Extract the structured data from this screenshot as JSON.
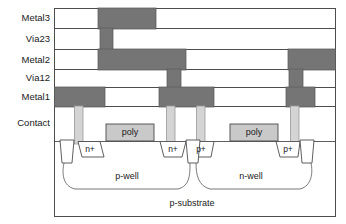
{
  "figure": {
    "type": "cross-section-diagram"
  },
  "colors": {
    "metal_fill": "#757575",
    "metal_stroke": "#5a5a5a",
    "poly_fill": "#c9c9c9",
    "poly_stroke": "#4a4a4a",
    "contact_fill": "#d4d4d4",
    "contact_stroke": "#9a9a9a",
    "outline": "#4d4d4d",
    "background": "#ffffff",
    "text": "#1a1a1a"
  },
  "layer_labels": [
    {
      "id": "metal3",
      "label": "Metal3",
      "y": 17
    },
    {
      "id": "via23",
      "label": "Via23",
      "y": 38
    },
    {
      "id": "metal2",
      "label": "Metal2",
      "y": 59
    },
    {
      "id": "via12",
      "label": "Via12",
      "y": 77
    },
    {
      "id": "metal1",
      "label": "Metal1",
      "y": 96
    },
    {
      "id": "contact",
      "label": "Contact",
      "y": 122
    }
  ],
  "stack_rows": [
    {
      "id": "row-metal3",
      "y": 8,
      "height": 20
    },
    {
      "id": "row-via23",
      "y": 28,
      "height": 21
    },
    {
      "id": "row-metal2",
      "y": 49,
      "height": 20
    },
    {
      "id": "row-via12",
      "y": 69,
      "height": 18
    },
    {
      "id": "row-metal1",
      "y": 87,
      "height": 19
    }
  ],
  "metal_bars": [
    {
      "id": "metal3-bar",
      "layer": "Metal3",
      "x": 98,
      "y": 8,
      "width": 58,
      "height": 20
    },
    {
      "id": "via23-plug",
      "layer": "Via23",
      "x": 100,
      "y": 28,
      "width": 13,
      "height": 21
    },
    {
      "id": "metal2-bar-left",
      "layer": "Metal2",
      "x": 98,
      "y": 49,
      "width": 88,
      "height": 20
    },
    {
      "id": "metal2-bar-right",
      "layer": "Metal2",
      "x": 288,
      "y": 49,
      "width": 48,
      "height": 20
    },
    {
      "id": "via12-plug-mid",
      "layer": "Via12",
      "x": 167,
      "y": 69,
      "width": 14,
      "height": 18
    },
    {
      "id": "via12-plug-right",
      "layer": "Via12",
      "x": 289,
      "y": 69,
      "width": 14,
      "height": 18
    },
    {
      "id": "metal1-bar-left",
      "layer": "Metal1",
      "x": 58,
      "y": 87,
      "width": 47,
      "height": 19
    },
    {
      "id": "metal1-bar-mid",
      "layer": "Metal1",
      "x": 159,
      "y": 87,
      "width": 55,
      "height": 19
    },
    {
      "id": "metal1-bar-right",
      "layer": "Metal1",
      "x": 286,
      "y": 87,
      "width": 29,
      "height": 19
    }
  ],
  "contacts": [
    {
      "id": "contact-1",
      "x": 74,
      "y": 106,
      "width": 9,
      "height": 38
    },
    {
      "id": "contact-2",
      "x": 166,
      "y": 106,
      "width": 9,
      "height": 38
    },
    {
      "id": "contact-3",
      "x": 196,
      "y": 106,
      "width": 9,
      "height": 38
    },
    {
      "id": "contact-4",
      "x": 290,
      "y": 106,
      "width": 9,
      "height": 38
    }
  ],
  "poly_gates": [
    {
      "id": "poly-nmos",
      "label": "poly",
      "x": 106,
      "y": 124,
      "width": 48,
      "height": 16
    },
    {
      "id": "poly-pmos",
      "label": "poly",
      "x": 230,
      "y": 124,
      "width": 48,
      "height": 16
    }
  ],
  "diffusions": [
    {
      "id": "diff-n-plus-left",
      "label": "n+",
      "cx": 88,
      "cy": 149
    },
    {
      "id": "diff-n-plus-mid",
      "label": "n+",
      "cx": 173,
      "cy": 149
    },
    {
      "id": "diff-p-plus-mid",
      "label": "p+",
      "cx": 199,
      "cy": 149
    },
    {
      "id": "diff-p-plus-right",
      "label": "p+",
      "cx": 288,
      "cy": 149
    }
  ],
  "wells": [
    {
      "id": "well-p",
      "label": "p-well",
      "cx": 137,
      "cy": 176
    },
    {
      "id": "well-n",
      "label": "n-well",
      "cx": 251,
      "cy": 176
    },
    {
      "id": "substrate",
      "label": "p-substrate",
      "cx": 192,
      "cy": 203
    }
  ],
  "frame": {
    "x": 54,
    "y": 8,
    "width": 282,
    "height": 209
  }
}
